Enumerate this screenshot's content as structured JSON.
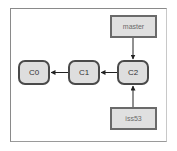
{
  "diagram": {
    "type": "git-branch-graph",
    "commits": [
      {
        "id": "c0",
        "label": "C0"
      },
      {
        "id": "c1",
        "label": "C1"
      },
      {
        "id": "c2",
        "label": "C2"
      }
    ],
    "branches": [
      {
        "id": "master",
        "label": "master",
        "points_to": "C2"
      },
      {
        "id": "iss53",
        "label": "iss53",
        "points_to": "C2"
      }
    ],
    "edges": [
      {
        "from": "C1",
        "to": "C0"
      },
      {
        "from": "C2",
        "to": "C1"
      },
      {
        "from": "master",
        "to": "C2"
      },
      {
        "from": "iss53",
        "to": "C2"
      }
    ],
    "colors": {
      "node_fill": "#dedede",
      "node_border": "#4a4a4a",
      "branch_fill": "#e0e0e0",
      "branch_border": "#6a6a6a",
      "arrow": "#222222",
      "frame_border": "#8a8a8a"
    }
  }
}
